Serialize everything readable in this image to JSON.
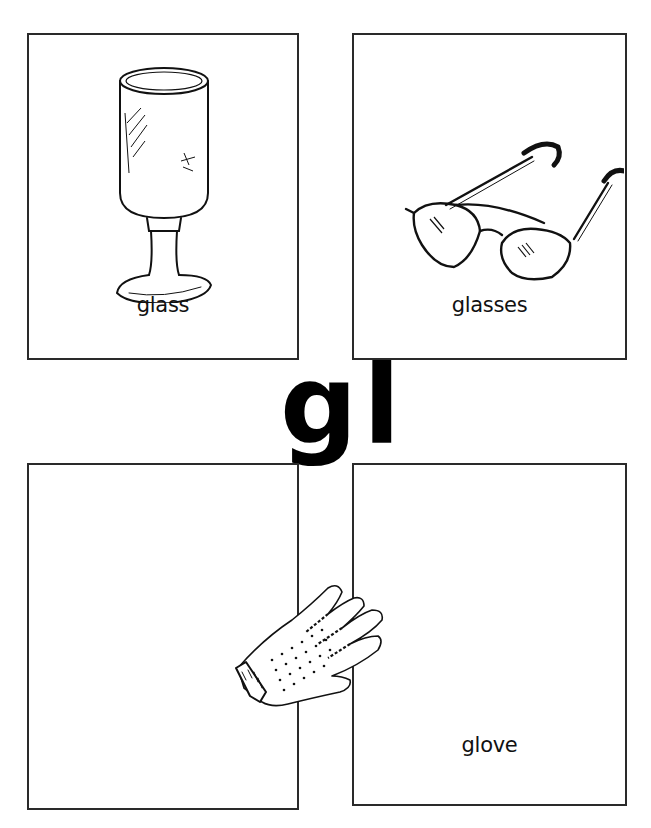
{
  "page": {
    "digraph": "gl"
  },
  "cards": [
    {
      "id": "glass",
      "label": "glass",
      "picture": "wine-goblet-drawing"
    },
    {
      "id": "glasses",
      "label": "glasses",
      "picture": "eyeglasses-drawing"
    },
    {
      "id": "blank",
      "label": "",
      "picture": "empty"
    },
    {
      "id": "glove",
      "label": "glove",
      "picture": "glove-drawing"
    }
  ],
  "colors": {
    "ink": "#111111",
    "border": "#2a2a2a",
    "background": "#ffffff"
  }
}
